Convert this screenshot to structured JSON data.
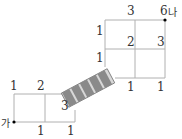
{
  "diagram": {
    "type": "grid-path-with-bridge",
    "start_label": "가",
    "end_label": "나",
    "lower_grid": {
      "top_labels": [
        "1",
        "2"
      ],
      "inner_label": "3",
      "bottom_labels": [
        "1",
        "1"
      ]
    },
    "upper_grid": {
      "top_labels": [
        "3",
        "6"
      ],
      "left_labels": [
        "1",
        "1"
      ],
      "inner_labels": [
        "2",
        "3"
      ],
      "bottom_labels": [
        "1",
        "1"
      ]
    },
    "bridge": {
      "segments": 5,
      "color": "#8a8a8a"
    },
    "line_color": "#b0b0b0"
  }
}
